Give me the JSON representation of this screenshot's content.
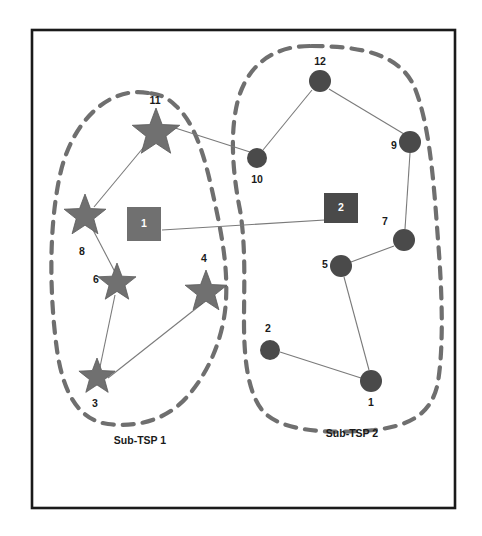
{
  "figure": {
    "width": 482,
    "height": 536,
    "background": "#ffffff",
    "frame": {
      "x": 32,
      "y": 30,
      "width": 423,
      "height": 478,
      "stroke": "#1a1a1a"
    }
  },
  "colors": {
    "star_fill": "#707070",
    "circle_fill": "#4a4a4a",
    "square_depot_1_fill": "#707070",
    "square_depot_2_fill": "#4a4a4a",
    "edge": "#7a7a7a",
    "cluster_outline": "#6f6f6f",
    "label_text": "#1a1a1a",
    "marker_text": "#ffffff"
  },
  "chart_data": {
    "type": "scatter",
    "title": "",
    "xlabel": "",
    "ylabel": "",
    "clusters": [
      {
        "name": "Sub-TSP 1",
        "caption": "Sub-TSP 1",
        "marker": "star",
        "node_ids": [
          11,
          8,
          6,
          3,
          4
        ],
        "depot": 1
      },
      {
        "name": "Sub-TSP 2",
        "caption": "Sub-TSP 2",
        "marker": "circle",
        "node_ids": [
          12,
          10,
          9,
          7,
          5,
          2,
          1
        ],
        "depot": 2
      }
    ],
    "nodes": [
      {
        "id": "11",
        "label": "11",
        "shape": "star",
        "x": 156,
        "y": 133,
        "size": 25,
        "label_x": 155,
        "label_y": 101
      },
      {
        "id": "8",
        "label": "8",
        "shape": "star",
        "x": 85,
        "y": 216,
        "size": 22,
        "label_x": 82,
        "label_y": 252
      },
      {
        "id": "6",
        "label": "6",
        "shape": "star",
        "x": 117,
        "y": 283,
        "size": 20,
        "label_x": 96,
        "label_y": 280
      },
      {
        "id": "3",
        "label": "3",
        "shape": "star",
        "x": 97,
        "y": 377,
        "size": 19,
        "label_x": 95,
        "label_y": 404
      },
      {
        "id": "4",
        "label": "4",
        "shape": "star",
        "x": 206,
        "y": 292,
        "size": 22,
        "label_x": 204,
        "label_y": 259
      },
      {
        "id": "12",
        "label": "12",
        "shape": "circle",
        "x": 320,
        "y": 81,
        "size": 11,
        "label_x": 320,
        "label_y": 62
      },
      {
        "id": "10",
        "label": "10",
        "shape": "circle",
        "x": 257,
        "y": 158,
        "size": 10,
        "label_x": 257,
        "label_y": 180
      },
      {
        "id": "9",
        "label": "9",
        "shape": "circle",
        "x": 410,
        "y": 142,
        "size": 11,
        "label_x": 394,
        "label_y": 146
      },
      {
        "id": "7",
        "label": "7",
        "shape": "circle",
        "x": 404,
        "y": 240,
        "size": 11,
        "label_x": 385,
        "label_y": 222
      },
      {
        "id": "5",
        "label": "5",
        "shape": "circle",
        "x": 341,
        "y": 266,
        "size": 11,
        "label_x": 325,
        "label_y": 265
      },
      {
        "id": "2",
        "label": "2",
        "shape": "circle",
        "x": 270,
        "y": 350,
        "size": 10,
        "label_x": 268,
        "label_y": 329
      },
      {
        "id": "1",
        "label": "1",
        "shape": "circle",
        "x": 371,
        "y": 381,
        "size": 11,
        "label_x": 371,
        "label_y": 403
      }
    ],
    "depots": [
      {
        "id": "d1",
        "label": "1",
        "shape": "square",
        "x": 144,
        "y": 224,
        "width": 34,
        "height": 34,
        "fill": "#707070"
      },
      {
        "id": "d2",
        "label": "2",
        "shape": "square",
        "x": 341,
        "y": 208,
        "width": 34,
        "height": 30,
        "fill": "#4a4a4a"
      }
    ],
    "edges": [
      {
        "from": "11",
        "to": "10",
        "x1": 169,
        "y1": 126,
        "x2": 250,
        "y2": 152
      },
      {
        "from": "11",
        "to": "8",
        "x1": 148,
        "y1": 142,
        "x2": 94,
        "y2": 207
      },
      {
        "from": "8",
        "to": "6",
        "x1": 92,
        "y1": 228,
        "x2": 115,
        "y2": 272
      },
      {
        "from": "6",
        "to": "3",
        "x1": 115,
        "y1": 295,
        "x2": 100,
        "y2": 367
      },
      {
        "from": "3",
        "to": "4",
        "x1": 108,
        "y1": 378,
        "x2": 203,
        "y2": 303
      },
      {
        "from": "d1",
        "to": "d2",
        "x1": 162,
        "y1": 230,
        "x2": 341,
        "y2": 219
      },
      {
        "from": "12",
        "to": "10",
        "x1": 312,
        "y1": 90,
        "x2": 263,
        "y2": 150
      },
      {
        "from": "12",
        "to": "9",
        "x1": 329,
        "y1": 89,
        "x2": 404,
        "y2": 134
      },
      {
        "from": "9",
        "to": "7",
        "x1": 410,
        "y1": 153,
        "x2": 405,
        "y2": 229
      },
      {
        "from": "7",
        "to": "5",
        "x1": 394,
        "y1": 246,
        "x2": 351,
        "y2": 262
      },
      {
        "from": "5",
        "to": "1",
        "x1": 344,
        "y1": 277,
        "x2": 369,
        "y2": 370
      },
      {
        "from": "1",
        "to": "2",
        "x1": 361,
        "y1": 378,
        "x2": 280,
        "y2": 352
      }
    ],
    "cluster_outlines": [
      {
        "name": "Sub-TSP 1",
        "path": "M 148 93 C 110 86, 72 120, 60 175 C 48 230, 50 300, 57 350 C 63 392, 78 420, 108 424 C 140 428, 168 418, 186 398 C 208 374, 224 338, 226 300 C 228 262, 220 226, 212 190 C 204 154, 194 122, 176 106 C 166 96, 158 94, 148 93 Z"
      },
      {
        "name": "Sub-TSP 2",
        "path": "M 310 46 C 274 46, 248 64, 238 100 C 230 130, 232 170, 240 210 C 246 246, 244 286, 244 322 C 244 360, 248 392, 262 410 C 280 432, 330 434, 374 430 C 410 426, 432 414, 438 382 C 444 344, 442 290, 438 240 C 434 186, 430 124, 414 86 C 398 52, 356 46, 310 46 Z"
      }
    ],
    "captions": [
      {
        "text": "Sub-TSP 1",
        "x": 140,
        "y": 441
      },
      {
        "text": "Sub-TSP 2",
        "x": 352,
        "y": 434
      }
    ]
  }
}
